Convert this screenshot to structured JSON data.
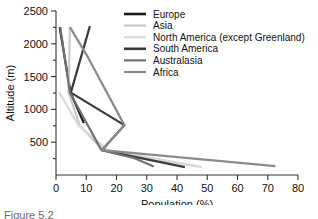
{
  "chart_data": {
    "type": "line",
    "title": "",
    "xlabel": "Population (%)",
    "ylabel": "Altitude (m)",
    "xlim": [
      0,
      80
    ],
    "ylim": [
      0,
      2500
    ],
    "xticks": [
      0,
      10,
      20,
      30,
      40,
      50,
      60,
      70,
      80
    ],
    "yticks": [
      500,
      1000,
      1500,
      2000,
      2500
    ],
    "yminorticks": [
      250,
      750,
      1250,
      1750,
      2250
    ],
    "grid": false,
    "legend_position": "top-right",
    "orientation": "x=Population (%), y=Altitude (m)",
    "series": [
      {
        "name": "Europe",
        "color": "#1a1a1a",
        "width": 2.2,
        "points": [
          [
            1.2,
            2255
          ],
          [
            4.8,
            1255
          ],
          [
            9.2,
            790
          ]
        ]
      },
      {
        "name": "Asia",
        "color": "#c9c9c9",
        "width": 2.2,
        "points": [
          [
            4.6,
            2255
          ],
          [
            4.2,
            1255
          ],
          [
            7.8,
            760
          ],
          [
            15.4,
            380
          ],
          [
            46.5,
            135
          ]
        ]
      },
      {
        "name": "North America (except Greenland)",
        "color": "#d8d8d8",
        "width": 2.2,
        "points": [
          [
            1.0,
            1265
          ],
          [
            7.4,
            760
          ],
          [
            17.0,
            380
          ],
          [
            48.2,
            120
          ]
        ]
      },
      {
        "name": "South America",
        "color": "#3a3a3a",
        "width": 2.2,
        "points": [
          [
            11.2,
            2270
          ],
          [
            4.9,
            1255
          ],
          [
            22.6,
            760
          ],
          [
            15.2,
            380
          ],
          [
            42.6,
            120
          ]
        ]
      },
      {
        "name": "Australasia",
        "color": "#707070",
        "width": 2.2,
        "points": [
          [
            1.4,
            2255
          ],
          [
            4.6,
            1255
          ],
          [
            15.0,
            380
          ],
          [
            26.0,
            255
          ],
          [
            32.3,
            128
          ]
        ]
      },
      {
        "name": "Africa",
        "color": "#8a8a8a",
        "width": 2.2,
        "points": [
          [
            4.6,
            2255
          ],
          [
            10.5,
            1800
          ],
          [
            22.6,
            760
          ],
          [
            15.2,
            380
          ],
          [
            72.5,
            135
          ]
        ]
      }
    ]
  },
  "legend": {
    "entries": [
      {
        "label": "Europe"
      },
      {
        "label": "Asia"
      },
      {
        "label": "North America (except Greenland)"
      },
      {
        "label": "South America"
      },
      {
        "label": "Australasia"
      },
      {
        "label": "Africa"
      }
    ]
  },
  "axes": {
    "x_title": "Population (%)",
    "y_title": "Altitude (m)",
    "x_tick_labels": [
      "0",
      "10",
      "20",
      "30",
      "40",
      "50",
      "60",
      "70",
      "80"
    ],
    "y_tick_labels": [
      "500",
      "1000",
      "1500",
      "2000",
      "2500"
    ]
  },
  "caption": {
    "text": "Figure 5.2"
  }
}
